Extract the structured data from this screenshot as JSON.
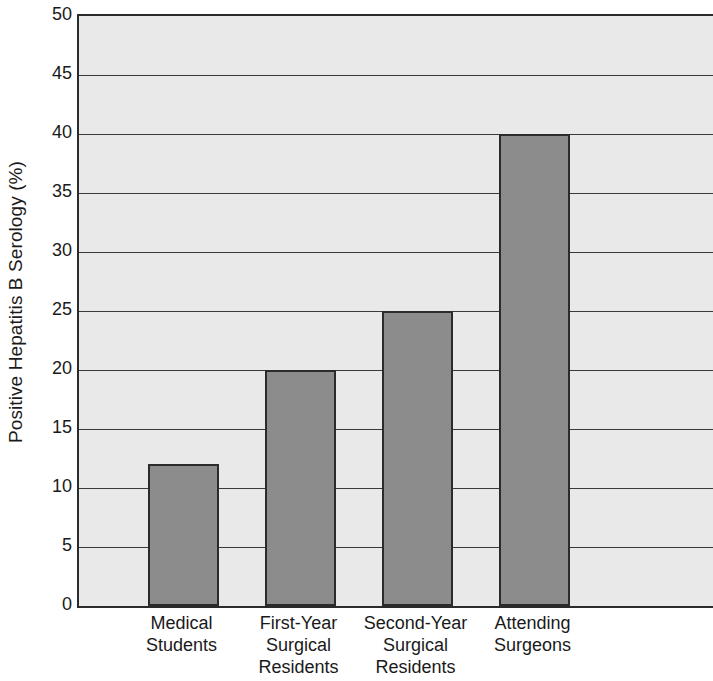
{
  "chart_data": {
    "type": "bar",
    "title": "",
    "subtitle": "",
    "xlabel": "",
    "ylabel": "Positive Hepatitis B Serology (%)",
    "categories": [
      "Medical\nStudents",
      "First-Year\nSurgical\nResidents",
      "Second-Year\nSurgical\nResidents",
      "Attending\nSurgeons"
    ],
    "values": [
      12,
      20,
      25,
      40
    ],
    "ylim": [
      0,
      50
    ],
    "ytick_step": 5,
    "yticks": [
      "0",
      "5",
      "10",
      "15",
      "20",
      "25",
      "30",
      "35",
      "40",
      "45",
      "50"
    ],
    "grid": "horizontal",
    "legend": "none",
    "colors": {
      "bar_fill": "#8c8c8c",
      "bar_border": "#2b2b2b",
      "plot_background": "#e9e9e9",
      "gridline": "#3a3a3a",
      "axis": "#2b2b2b",
      "text": "#1a1a1a",
      "page_background": "#ffffff"
    }
  }
}
